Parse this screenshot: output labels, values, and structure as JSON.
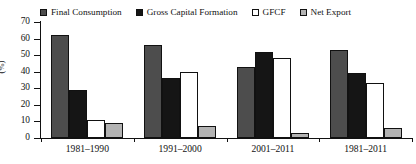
{
  "chart_data": {
    "type": "bar",
    "title": "",
    "subtitle": "",
    "xlabel": "",
    "ylabel": "(%)",
    "ylim": [
      0,
      70
    ],
    "yticks": [
      0,
      10,
      20,
      30,
      40,
      50,
      60,
      70
    ],
    "grid": false,
    "legend_position": "top",
    "categories": [
      "1981–1990",
      "1991–2000",
      "2001–2011",
      "1981–2011"
    ],
    "series": [
      {
        "name": "Final Consumption",
        "color": "#4d4d4d",
        "swatch": "filled-dark-gray",
        "values": [
          62,
          56,
          43,
          53
        ]
      },
      {
        "name": "Gross Capital Formation",
        "color": "#151515",
        "swatch": "filled-black",
        "values": [
          29,
          36,
          52,
          39
        ]
      },
      {
        "name": "GFCF",
        "color": "#ffffff",
        "swatch": "open-white",
        "values": [
          11,
          40,
          48,
          33
        ]
      },
      {
        "name": "Net Export",
        "color": "#b3b3b3",
        "swatch": "filled-light-gray",
        "values": [
          9,
          7,
          3,
          6
        ]
      }
    ]
  },
  "axis": {
    "y_tick_labels": [
      "70",
      "60",
      "50",
      "40",
      "30",
      "20",
      "10",
      "0"
    ],
    "y_axis_title": "(%)",
    "x_tick_labels": [
      "1981–1990",
      "1991–2000",
      "2001–2011",
      "1981–2011"
    ]
  },
  "legend": {
    "items": [
      {
        "label": "Final Consumption"
      },
      {
        "label": "Gross Capital Formation"
      },
      {
        "label": "GFCF"
      },
      {
        "label": "Net Export"
      }
    ]
  },
  "colors": {
    "final_consumption": "#4d4d4d",
    "gross_capital_formation": "#151515",
    "gfcf": "#ffffff",
    "net_export": "#b3b3b3",
    "axis": "#111111",
    "background": "#ffffff"
  }
}
